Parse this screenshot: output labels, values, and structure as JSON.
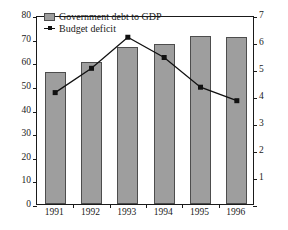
{
  "chart_data": {
    "type": "bar",
    "title": "",
    "subtitle": "",
    "xlabel": "",
    "ylabel": "",
    "y2label": "",
    "grid": false,
    "legend_position": "top-left",
    "categories": [
      "1991",
      "1992",
      "1993",
      "1994",
      "1995",
      "1996"
    ],
    "series": [
      {
        "name": "Government debt to GDP",
        "type": "bar",
        "axis": "left",
        "color": "#9e9e9e",
        "edge_color": "#4d4d4d",
        "values": [
          55.8,
          60.3,
          66.4,
          67.9,
          71.0,
          70.7
        ]
      },
      {
        "name": "Budget deficit",
        "type": "line",
        "axis": "right",
        "color": "#111111",
        "marker": "square",
        "values": [
          4.2,
          5.1,
          6.25,
          5.5,
          4.4,
          3.9
        ]
      }
    ],
    "ylim": [
      0,
      80
    ],
    "yticks": [
      0,
      10,
      20,
      30,
      40,
      50,
      60,
      70,
      80
    ],
    "ytick_labels": [
      "0",
      "10",
      "20",
      "30",
      "40",
      "50",
      "60",
      "70",
      "80"
    ],
    "y2lim": [
      0,
      7
    ],
    "y2ticks": [
      0,
      1,
      2,
      3,
      4,
      5,
      6,
      7
    ],
    "y2tick_labels": [
      "",
      "1",
      "2",
      "3",
      "4",
      "5",
      "6",
      "7"
    ],
    "xtick_labels": [
      "1991",
      "1992",
      "1993",
      "1994",
      "1995",
      "1996"
    ]
  },
  "legend": {
    "items": [
      {
        "label": "Government debt to GDP",
        "marker": "bar-swatch"
      },
      {
        "label": "Budget deficit",
        "marker": "line-marker-swatch"
      }
    ]
  }
}
